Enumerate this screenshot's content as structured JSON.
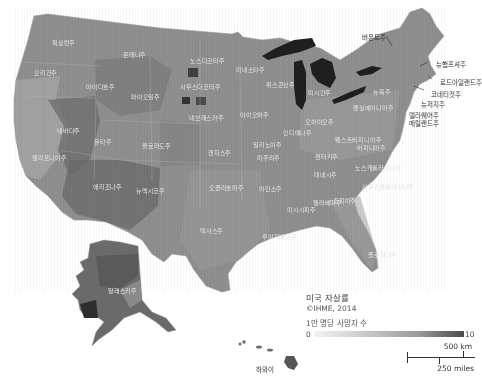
{
  "legend": {
    "title": "미국 자살률",
    "source": "©IHME, 2014",
    "unit": "1만 명당 사망자 수",
    "scale_min": "0",
    "scale_max": "10"
  },
  "scale_bar": {
    "km_label": "500 km",
    "miles_label": "250 miles"
  },
  "states_inside": [
    {
      "name": "워싱턴주",
      "x": 52,
      "y": 38
    },
    {
      "name": "오리건주",
      "x": 34,
      "y": 68
    },
    {
      "name": "아이다호주",
      "x": 86,
      "y": 82
    },
    {
      "name": "몬태나주",
      "x": 123,
      "y": 50
    },
    {
      "name": "와이오밍주",
      "x": 131,
      "y": 92
    },
    {
      "name": "노스다코타주",
      "x": 190,
      "y": 56
    },
    {
      "name": "사우스다코타주",
      "x": 180,
      "y": 82
    },
    {
      "name": "미네소타주",
      "x": 236,
      "y": 65
    },
    {
      "name": "위스콘신주",
      "x": 266,
      "y": 80
    },
    {
      "name": "미시간주",
      "x": 308,
      "y": 88
    },
    {
      "name": "네브래스카주",
      "x": 189,
      "y": 113
    },
    {
      "name": "아이오와주",
      "x": 240,
      "y": 110
    },
    {
      "name": "일리노이주",
      "x": 253,
      "y": 140
    },
    {
      "name": "인디애나주",
      "x": 283,
      "y": 128
    },
    {
      "name": "오하이오주",
      "x": 305,
      "y": 117
    },
    {
      "name": "펜실베이니아주",
      "x": 353,
      "y": 103
    },
    {
      "name": "뉴욕주",
      "x": 373,
      "y": 87
    },
    {
      "name": "네바다주",
      "x": 57,
      "y": 126
    },
    {
      "name": "유타주",
      "x": 94,
      "y": 137
    },
    {
      "name": "콜로라도주",
      "x": 142,
      "y": 141
    },
    {
      "name": "캘리포니아주",
      "x": 32,
      "y": 153
    },
    {
      "name": "캔자스주",
      "x": 208,
      "y": 148
    },
    {
      "name": "미주리주",
      "x": 257,
      "y": 153
    },
    {
      "name": "켄터키주",
      "x": 315,
      "y": 152
    },
    {
      "name": "웨스트버지니아주",
      "x": 335,
      "y": 135
    },
    {
      "name": "버지니아주",
      "x": 357,
      "y": 143
    },
    {
      "name": "노스캐롤라이나주",
      "x": 355,
      "y": 163
    },
    {
      "name": "테네시주",
      "x": 314,
      "y": 170
    },
    {
      "name": "사우스캐롤라이나주",
      "x": 362,
      "y": 182
    },
    {
      "name": "애리조나주",
      "x": 93,
      "y": 182
    },
    {
      "name": "뉴멕시코주",
      "x": 136,
      "y": 186
    },
    {
      "name": "오클라호마주",
      "x": 209,
      "y": 183
    },
    {
      "name": "아칸소주",
      "x": 259,
      "y": 184
    },
    {
      "name": "미시시피주",
      "x": 287,
      "y": 205
    },
    {
      "name": "앨라배마주",
      "x": 313,
      "y": 198
    },
    {
      "name": "조지아주",
      "x": 333,
      "y": 196
    },
    {
      "name": "텍사스주",
      "x": 200,
      "y": 226
    },
    {
      "name": "루이지애나주",
      "x": 262,
      "y": 232
    },
    {
      "name": "플로리다주",
      "x": 368,
      "y": 250
    },
    {
      "name": "알래스카주",
      "x": 108,
      "y": 286
    }
  ],
  "states_outside": [
    {
      "name": "버몬트주",
      "x": 362,
      "y": 32
    },
    {
      "name": "뉴햄프셔주",
      "x": 436,
      "y": 59
    },
    {
      "name": "로드아일랜드주",
      "x": 440,
      "y": 77
    },
    {
      "name": "코네티컷주",
      "x": 431,
      "y": 89
    },
    {
      "name": "뉴저지주",
      "x": 421,
      "y": 99
    },
    {
      "name": "델라웨어주",
      "x": 409,
      "y": 110
    },
    {
      "name": "메릴랜드주",
      "x": 409,
      "y": 118
    },
    {
      "name": "하와이",
      "x": 256,
      "y": 364
    }
  ],
  "colors": {
    "land_base": "#8c8c8c",
    "land_dark": "#555555",
    "land_light": "#b0b0b0",
    "lakes": "#222222",
    "background": "#ffffff"
  }
}
